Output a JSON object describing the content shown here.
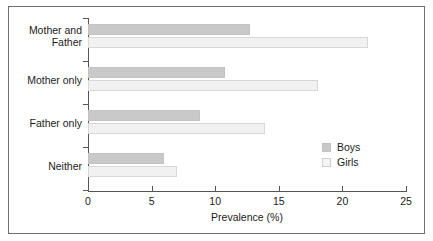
{
  "chart_data": {
    "type": "bar",
    "orientation": "horizontal",
    "title": "",
    "xlabel": "Prevalence (%)",
    "ylabel": "",
    "categories": [
      "Mother and Father",
      "Mother only",
      "Father only",
      "Neither"
    ],
    "series": [
      {
        "name": "Boys",
        "color": "#c9c9c9",
        "values": [
          12.7,
          10.8,
          8.8,
          6.0
        ]
      },
      {
        "name": "Girls",
        "color": "#f1f1f1",
        "values": [
          22.0,
          18.1,
          13.9,
          7.0
        ]
      }
    ],
    "xlim": [
      0,
      25
    ],
    "xticks": [
      0,
      5,
      10,
      15,
      20,
      25
    ],
    "xtick_labels": [
      "0",
      "5",
      "10",
      "15",
      "20",
      "25"
    ],
    "grid": false,
    "legend_position": "center-right",
    "legend_entries": [
      "Boys",
      "Girls"
    ]
  },
  "axis": {
    "x_title": "Prevalence (%)"
  },
  "legend": {
    "items": [
      {
        "label": "Boys"
      },
      {
        "label": "Girls"
      }
    ]
  },
  "category_labels": {
    "mother_and_father_line1": "Mother and",
    "mother_and_father_line2": "Father",
    "mother_only": "Mother only",
    "father_only": "Father only",
    "neither": "Neither"
  }
}
